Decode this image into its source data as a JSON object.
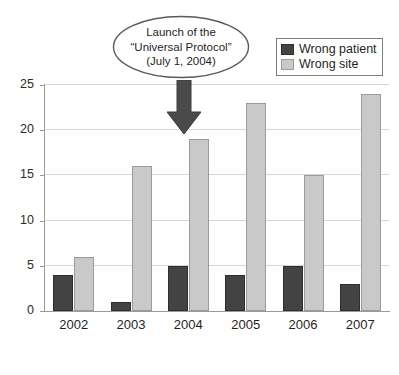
{
  "chart_data": {
    "type": "bar",
    "title": "",
    "subtitle": "",
    "xlabel": "",
    "ylabel": "",
    "categories": [
      "2002",
      "2003",
      "2004",
      "2005",
      "2006",
      "2007"
    ],
    "series": [
      {
        "name": "Wrong patient",
        "color": "#434343",
        "values": [
          4,
          1,
          5,
          4,
          5,
          3
        ]
      },
      {
        "name": "Wrong site",
        "color": "#c9c9c9",
        "values": [
          6,
          16,
          19,
          23,
          15,
          24
        ]
      }
    ],
    "ylim": [
      0,
      25
    ],
    "yticks": [
      0,
      5,
      10,
      15,
      20,
      25
    ],
    "grid": true,
    "legend_position": "top-right",
    "annotations": [
      {
        "kind": "callout-ellipse-with-arrow",
        "lines": [
          "Launch of the",
          "“Universal Protocol”",
          "(July 1, 2004)"
        ],
        "points_to_category": "2004"
      }
    ]
  },
  "legend": {
    "entries": [
      {
        "label": "Wrong patient"
      },
      {
        "label": "Wrong site"
      }
    ]
  },
  "callout": {
    "line1": "Launch of the",
    "line2": "“Universal Protocol”",
    "line3": "(July 1, 2004)"
  },
  "axes": {
    "y": {
      "ticks": [
        "0",
        "5",
        "10",
        "15",
        "20",
        "25"
      ]
    },
    "x": {
      "ticks": [
        "2002",
        "2003",
        "2004",
        "2005",
        "2006",
        "2007"
      ]
    }
  }
}
